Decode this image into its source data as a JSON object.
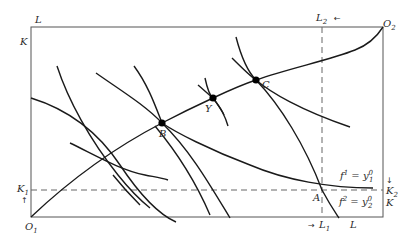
{
  "diagram": {
    "labels": {
      "top_left_L": "L",
      "left_K": "K",
      "L2": "L",
      "L2_sub": "2",
      "L2_arrow": "←",
      "O2": "O",
      "O2_sub": "2",
      "K1": "K",
      "K1_sub": "1",
      "K1_arrow": "↑",
      "K2": "K",
      "K2_sub": "2",
      "K2_arrow": "↓",
      "right_K": "K",
      "O1": "O",
      "O1_sub": "1",
      "L1_arrow": "→",
      "L1": "L",
      "L1_sub": "1",
      "bottom_L": "L",
      "point_A": "A",
      "point_B": "B",
      "point_Y": "Y",
      "point_C": "C",
      "f1_eq": "f",
      "f1_sup": "1",
      "f1_rhs": " = y",
      "f1_rhs_sup": "0",
      "f1_rhs_sub": "1",
      "f2_eq": "f",
      "f2_sup": "2",
      "f2_rhs": " = y",
      "f2_rhs_sup": "0",
      "f2_rhs_sub": "2"
    },
    "points": [
      {
        "name": "A",
        "x": 322,
        "y": 190
      },
      {
        "name": "B",
        "x": 162,
        "y": 123
      },
      {
        "name": "Y",
        "x": 213,
        "y": 98
      },
      {
        "name": "C",
        "x": 256,
        "y": 80
      }
    ],
    "colors": {
      "line": "#1a1a1a",
      "box": "#555555",
      "dash": "#666666",
      "background": "#ffffff"
    }
  }
}
